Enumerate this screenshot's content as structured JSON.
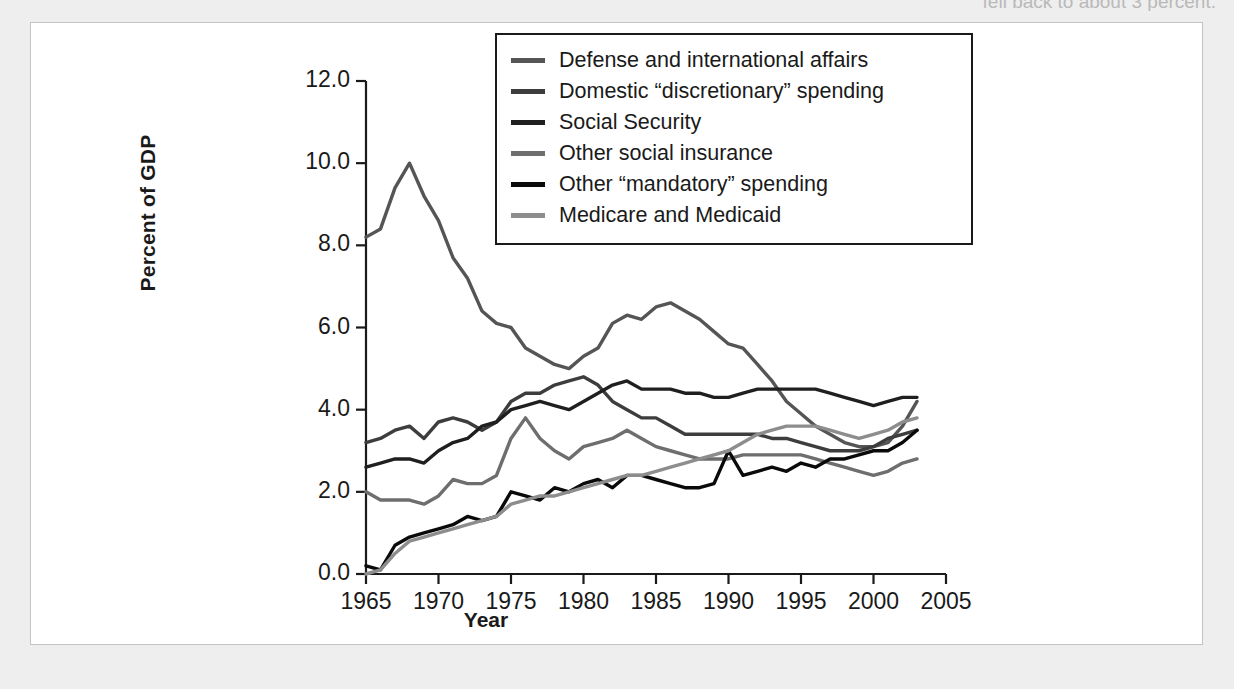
{
  "page": {
    "cutoff_body_text": "fell back to about 3 percent."
  },
  "chart_data": {
    "type": "line",
    "title": "",
    "xlabel": "Year",
    "ylabel": "Percent of GDP",
    "xlim": [
      1965,
      2005
    ],
    "ylim": [
      0.0,
      12.0
    ],
    "xticks": [
      1965,
      1970,
      1975,
      1980,
      1985,
      1990,
      1995,
      2000,
      2005
    ],
    "xtick_labels": [
      "1965",
      "1970",
      "1975",
      "1980",
      "1985",
      "1990",
      "1995",
      "2000",
      "2005"
    ],
    "yticks": [
      0.0,
      2.0,
      4.0,
      6.0,
      8.0,
      10.0,
      12.0
    ],
    "ytick_labels": [
      "0.0",
      "2.0",
      "4.0",
      "6.0",
      "8.0",
      "10.0",
      "12.0"
    ],
    "grid": false,
    "legend_position": "top-center",
    "x": [
      1965,
      1966,
      1967,
      1968,
      1969,
      1970,
      1971,
      1972,
      1973,
      1974,
      1975,
      1976,
      1977,
      1978,
      1979,
      1980,
      1981,
      1982,
      1983,
      1984,
      1985,
      1986,
      1987,
      1988,
      1989,
      1990,
      1991,
      1992,
      1993,
      1994,
      1995,
      1996,
      1997,
      1998,
      1999,
      2000,
      2001,
      2002,
      2003
    ],
    "series": [
      {
        "name": "Defense and international affairs",
        "color": "#555555",
        "values": [
          8.2,
          8.4,
          9.4,
          10.0,
          9.2,
          8.6,
          7.7,
          7.2,
          6.4,
          6.1,
          6.0,
          5.5,
          5.3,
          5.1,
          5.0,
          5.3,
          5.5,
          6.1,
          6.3,
          6.2,
          6.5,
          6.6,
          6.4,
          6.2,
          5.9,
          5.6,
          5.5,
          5.1,
          4.7,
          4.2,
          3.9,
          3.6,
          3.4,
          3.2,
          3.1,
          3.1,
          3.2,
          3.6,
          4.2
        ]
      },
      {
        "name": "Domestic “discretionary” spending",
        "color": "#3d3d3d",
        "values": [
          3.2,
          3.3,
          3.5,
          3.6,
          3.3,
          3.7,
          3.8,
          3.7,
          3.5,
          3.7,
          4.2,
          4.4,
          4.4,
          4.6,
          4.7,
          4.8,
          4.6,
          4.2,
          4.0,
          3.8,
          3.8,
          3.6,
          3.4,
          3.4,
          3.4,
          3.4,
          3.4,
          3.4,
          3.3,
          3.3,
          3.2,
          3.1,
          3.0,
          3.0,
          3.0,
          3.1,
          3.3,
          3.4,
          3.5
        ]
      },
      {
        "name": "Social Security",
        "color": "#1f1f1f",
        "values": [
          2.6,
          2.7,
          2.8,
          2.8,
          2.7,
          3.0,
          3.2,
          3.3,
          3.6,
          3.7,
          4.0,
          4.1,
          4.2,
          4.1,
          4.0,
          4.2,
          4.4,
          4.6,
          4.7,
          4.5,
          4.5,
          4.5,
          4.4,
          4.4,
          4.3,
          4.3,
          4.4,
          4.5,
          4.5,
          4.5,
          4.5,
          4.5,
          4.4,
          4.3,
          4.2,
          4.1,
          4.2,
          4.3,
          4.3
        ]
      },
      {
        "name": "Other social insurance",
        "color": "#6e6e6e",
        "values": [
          2.0,
          1.8,
          1.8,
          1.8,
          1.7,
          1.9,
          2.3,
          2.2,
          2.2,
          2.4,
          3.3,
          3.8,
          3.3,
          3.0,
          2.8,
          3.1,
          3.2,
          3.3,
          3.5,
          3.3,
          3.1,
          3.0,
          2.9,
          2.8,
          2.8,
          2.8,
          2.9,
          2.9,
          2.9,
          2.9,
          2.9,
          2.8,
          2.7,
          2.6,
          2.5,
          2.4,
          2.5,
          2.7,
          2.8
        ]
      },
      {
        "name": "Other “mandatory” spending",
        "color": "#0a0a0a",
        "values": [
          0.2,
          0.1,
          0.7,
          0.9,
          1.0,
          1.1,
          1.2,
          1.4,
          1.3,
          1.4,
          2.0,
          1.9,
          1.8,
          2.1,
          2.0,
          2.2,
          2.3,
          2.1,
          2.4,
          2.4,
          2.3,
          2.2,
          2.1,
          2.1,
          2.2,
          3.0,
          2.4,
          2.5,
          2.6,
          2.5,
          2.7,
          2.6,
          2.8,
          2.8,
          2.9,
          3.0,
          3.0,
          3.2,
          3.5
        ]
      },
      {
        "name": "Medicare and Medicaid",
        "color": "#8d8d8d",
        "values": [
          0.0,
          0.1,
          0.5,
          0.8,
          0.9,
          1.0,
          1.1,
          1.2,
          1.3,
          1.4,
          1.7,
          1.8,
          1.9,
          1.9,
          2.0,
          2.1,
          2.2,
          2.3,
          2.4,
          2.4,
          2.5,
          2.6,
          2.7,
          2.8,
          2.9,
          3.0,
          3.2,
          3.4,
          3.5,
          3.6,
          3.6,
          3.6,
          3.5,
          3.4,
          3.3,
          3.4,
          3.5,
          3.7,
          3.8
        ]
      }
    ]
  }
}
